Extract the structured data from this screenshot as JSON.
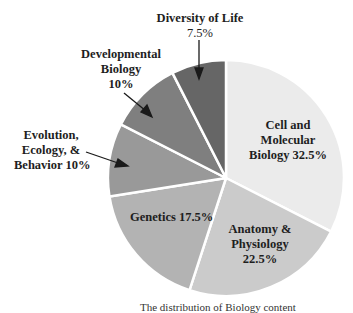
{
  "chart_data": {
    "type": "pie",
    "title": "",
    "caption": "The distribution of Biology content",
    "start_angle_deg": 0,
    "direction": "clockwise",
    "slices": [
      {
        "label": "Cell and Molecular Biology",
        "value": 32.5,
        "display": [
          "Cell and",
          "Molecular",
          "Biology 32.5%"
        ],
        "color": "#ebebeb"
      },
      {
        "label": "Anatomy & Physiology",
        "value": 22.5,
        "display": [
          "Anatomy &",
          "Physiology",
          "22.5%"
        ],
        "color": "#cbcbcb"
      },
      {
        "label": "Genetics",
        "value": 17.5,
        "display": [
          "Genetics 17.5%"
        ],
        "color": "#b3b3b3"
      },
      {
        "label": "Evolution, Ecology, & Behavior",
        "value": 10,
        "display": [
          "Evolution,",
          "Ecology, &",
          "Behavior 10%"
        ],
        "color": "#999999"
      },
      {
        "label": "Developmental Biology",
        "value": 10,
        "display": [
          "Developmental",
          "Biology",
          "10%"
        ],
        "color": "#7f7f7f"
      },
      {
        "label": "Diversity of Life",
        "value": 7.5,
        "display": [
          "Diversity of Life",
          "7.5%"
        ],
        "color": "#666666"
      }
    ]
  },
  "labels": {
    "cell": [
      "Cell and",
      "Molecular",
      "Biology 32.5%"
    ],
    "anatomy": [
      "Anatomy &",
      "Physiology",
      "22.5%"
    ],
    "genetics": [
      "Genetics 17.5%"
    ],
    "evolution": [
      "Evolution,",
      "Ecology, &",
      "Behavior 10%"
    ],
    "developmental": [
      "Developmental",
      "Biology",
      "10%"
    ],
    "diversity": [
      "Diversity of Life",
      "7.5%"
    ]
  }
}
